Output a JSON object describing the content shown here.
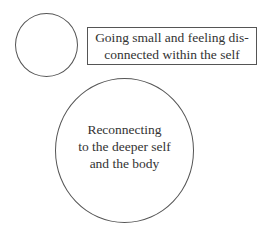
{
  "diagram": {
    "small_circle": {
      "label": ""
    },
    "box": {
      "lines": [
        "Going small and feeling dis-",
        "connected within the self"
      ]
    },
    "big_circle": {
      "lines": [
        "Reconnecting",
        "to the deeper self",
        "and the body"
      ]
    },
    "colors": {
      "stroke": "#555555",
      "text": "#333333",
      "background": "#ffffff"
    }
  }
}
